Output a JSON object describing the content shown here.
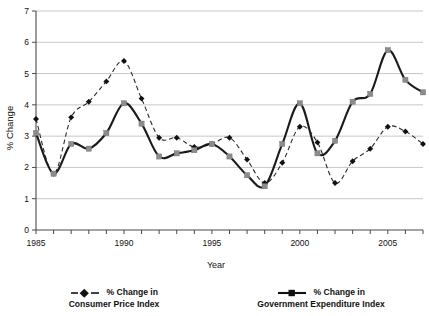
{
  "chart_data": {
    "type": "line",
    "title": "",
    "xlabel": "Year",
    "ylabel": "% Change",
    "xlim": [
      1985,
      2007
    ],
    "ylim": [
      0,
      7
    ],
    "ytick_step": 1,
    "yticks": [
      "0",
      "1",
      "2",
      "3",
      "4",
      "5",
      "6",
      "7"
    ],
    "xticks_major": [
      "1985",
      "1990",
      "1995",
      "2000",
      "2005"
    ],
    "xticks_all": [
      1985,
      1986,
      1987,
      1988,
      1989,
      1990,
      1991,
      1992,
      1993,
      1994,
      1995,
      1996,
      1997,
      1998,
      1999,
      2000,
      2001,
      2002,
      2003,
      2004,
      2005,
      2006,
      2007
    ],
    "grid": "horizontal",
    "legend_position": "bottom",
    "x": [
      1985,
      1986,
      1987,
      1988,
      1989,
      1990,
      1991,
      1992,
      1993,
      1994,
      1995,
      1996,
      1997,
      1998,
      1999,
      2000,
      2001,
      2002,
      2003,
      2004,
      2005,
      2006,
      2007
    ],
    "series": [
      {
        "name": "% Change in Consumer Price Index",
        "style": "dashed",
        "marker": "diamond",
        "marker_color": "#111111",
        "line_color": "#2a2a2a",
        "values": [
          3.55,
          1.8,
          3.6,
          4.1,
          4.75,
          5.4,
          4.2,
          2.95,
          2.95,
          2.65,
          2.75,
          2.95,
          2.25,
          1.5,
          2.15,
          3.3,
          2.8,
          1.5,
          2.2,
          2.6,
          3.3,
          3.15,
          2.75
        ]
      },
      {
        "name": "% Change in Government Expenditure Index",
        "style": "solid",
        "marker": "square",
        "marker_color": "#8c8c8c",
        "line_color": "#1a1a1a",
        "values": [
          3.1,
          1.8,
          2.75,
          2.6,
          3.1,
          4.05,
          3.4,
          2.35,
          2.45,
          2.55,
          2.75,
          2.35,
          1.75,
          1.4,
          2.75,
          4.05,
          2.45,
          2.85,
          4.1,
          4.35,
          5.75,
          4.8,
          4.4
        ]
      }
    ]
  },
  "legend": {
    "cpi": {
      "line1": "% Change in",
      "line2": "Consumer Price Index"
    },
    "gov": {
      "line1": "% Change in",
      "line2": "Government Expenditure Index"
    }
  },
  "axes": {
    "y_title": "% Change",
    "x_title": "Year"
  }
}
